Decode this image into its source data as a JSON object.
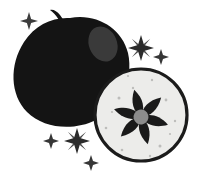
{
  "artwork": {
    "title": "Apple with cut half",
    "subject": "apple",
    "style": "high-contrast black and white clipart illustration",
    "background_color": "#ffffff",
    "canvas": {
      "width": 200,
      "height": 180
    }
  },
  "palette": {
    "apple_body": "#141414",
    "apple_highlight": "#3a3a3a",
    "stem": "#141414",
    "cut_face_fill": "#ececea",
    "cut_face_outline": "#1b1b1b",
    "seed_core_dark": "#1a1a1a",
    "seed_core_center": "#8c8c8c",
    "sparkle": "#2b2b2b",
    "background": "#ffffff"
  },
  "elements": {
    "whole_apple": {
      "label": "Whole apple silhouette",
      "fill": "#141414",
      "center_x": 71,
      "center_y": 73,
      "radius_x": 59,
      "radius_y": 56
    },
    "apple_highlight": {
      "label": "Glossy highlight on apple",
      "fill": "#3a3a3a",
      "center_x": 103,
      "center_y": 44,
      "radius_x": 14,
      "radius_y": 18,
      "rotation_deg": -22
    },
    "stem": {
      "label": "Apple stem",
      "fill": "#141414",
      "start_x": 63,
      "start_y": 27,
      "tip_x": 51,
      "tip_y": 11
    },
    "cut_half": {
      "label": "Cut apple half showing core",
      "fill": "#ececea",
      "outline": "#1b1b1b",
      "outline_width": 3,
      "center_x": 141,
      "center_y": 115,
      "radius": 47
    },
    "seed_core": {
      "label": "Star-shaped seed core",
      "points": 6,
      "petal_fill": "#1a1a1a",
      "center_fill": "#8c8c8c",
      "center_x": 141,
      "center_y": 117,
      "outer_radius": 26,
      "inner_radius": 8,
      "rotation_deg": -14
    }
  },
  "sparkles": [
    {
      "name": "sparkle-top-left",
      "x": 29,
      "y": 21,
      "size": 9,
      "opacity": 0.92
    },
    {
      "name": "sparkle-upper-right",
      "x": 141,
      "y": 48,
      "size": 13,
      "opacity": 1
    },
    {
      "name": "sparkle-right-small",
      "x": 161,
      "y": 57,
      "size": 8,
      "opacity": 0.95
    },
    {
      "name": "sparkle-lower-left",
      "x": 51,
      "y": 141,
      "size": 8,
      "opacity": 0.95
    },
    {
      "name": "sparkle-bottom-mid",
      "x": 77,
      "y": 141,
      "size": 13,
      "opacity": 1
    },
    {
      "name": "sparkle-bottom-small",
      "x": 91,
      "y": 163,
      "size": 8,
      "opacity": 0.95
    }
  ],
  "speckles": [
    {
      "x": 119,
      "y": 98,
      "r": 1.5
    },
    {
      "x": 133,
      "y": 88,
      "r": 1.2
    },
    {
      "x": 166,
      "y": 100,
      "r": 1.4
    },
    {
      "x": 175,
      "y": 121,
      "r": 1.2
    },
    {
      "x": 160,
      "y": 146,
      "r": 1.5
    },
    {
      "x": 122,
      "y": 150,
      "r": 1.3
    },
    {
      "x": 106,
      "y": 128,
      "r": 1.3
    },
    {
      "x": 112,
      "y": 112,
      "r": 1.1
    },
    {
      "x": 150,
      "y": 156,
      "r": 1.2
    },
    {
      "x": 170,
      "y": 134,
      "r": 1.1
    },
    {
      "x": 128,
      "y": 76,
      "r": 1.1
    },
    {
      "x": 152,
      "y": 80,
      "r": 1.2
    }
  ]
}
